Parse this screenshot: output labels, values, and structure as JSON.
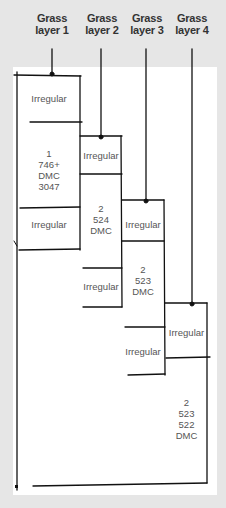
{
  "headers": [
    {
      "line1": "Grass",
      "line2": "layer 1"
    },
    {
      "line1": "Grass",
      "line2": "layer 2"
    },
    {
      "line1": "Grass",
      "line2": "layer 3"
    },
    {
      "line1": "Grass",
      "line2": "layer 4"
    }
  ],
  "labels": {
    "l1_irregular_top": "Irregular",
    "l1_main": [
      "1",
      "746+",
      "DMC",
      "3047"
    ],
    "l1_irregular_bottom": "Irregular",
    "l2_irregular_top": "Irregular",
    "l2_main": [
      "2",
      "524",
      "DMC"
    ],
    "l2_irregular_bottom": "Irregular",
    "l3_irregular_top": "Irregular",
    "l3_main": [
      "2",
      "523",
      "DMC"
    ],
    "l3_irregular_bottom": "Irregular",
    "l4_irregular_top": "Irregular",
    "l4_main": [
      "2",
      "523",
      "522",
      "DMC"
    ]
  },
  "colors": {
    "background": "#e6e6e6",
    "paper": "#ffffff",
    "line": "#111111",
    "header_text": "#333333",
    "label_text": "#555555"
  }
}
